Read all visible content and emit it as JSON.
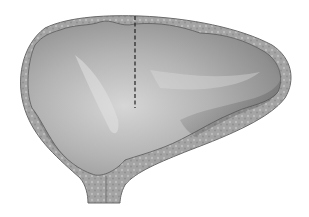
{
  "figure": {
    "colors": {
      "background": "#ffffff",
      "wall": "#a8a8a8",
      "wall_outline": "#6a6a6a",
      "lumen_light": "#d4d4d4",
      "lumen_mid": "#a6a6a6",
      "lumen_dark": "#6e6e6e",
      "dashed_line": "#222222"
    }
  }
}
